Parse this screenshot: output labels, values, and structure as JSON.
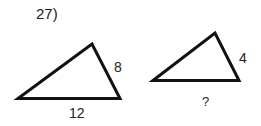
{
  "problem": {
    "number_label": "27)"
  },
  "triangles": [
    {
      "name": "triangle-large",
      "side_right_label": "8",
      "side_bottom_label": "12"
    },
    {
      "name": "triangle-small",
      "side_right_label": "4",
      "side_bottom_label": "?"
    }
  ],
  "colors": {
    "stroke": "#111111",
    "text": "#222222",
    "background": "#ffffff"
  }
}
